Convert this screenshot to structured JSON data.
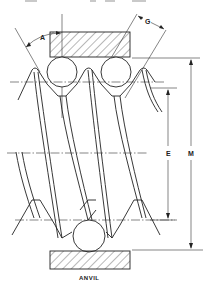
{
  "figure": {
    "type": "engineering-drawing",
    "header_text_cutoff": "",
    "labels": {
      "angle": "A",
      "wire_diameter": "G",
      "pitch_diameter": "E",
      "measurement_over_wires": "M",
      "anvil": "ANVIL"
    },
    "components": [
      {
        "name": "upper-measuring-block",
        "hatched": true
      },
      {
        "name": "upper-wire-left"
      },
      {
        "name": "upper-wire-right"
      },
      {
        "name": "lower-wire"
      },
      {
        "name": "anvil",
        "hatched": true
      }
    ],
    "dimensions": [
      {
        "label": "E",
        "description": "distance between wire-contact pitch lines"
      },
      {
        "label": "M",
        "description": "overall distance from block face to anvil face"
      }
    ],
    "colors": {
      "line": "#222222",
      "background": "#ffffff"
    }
  }
}
